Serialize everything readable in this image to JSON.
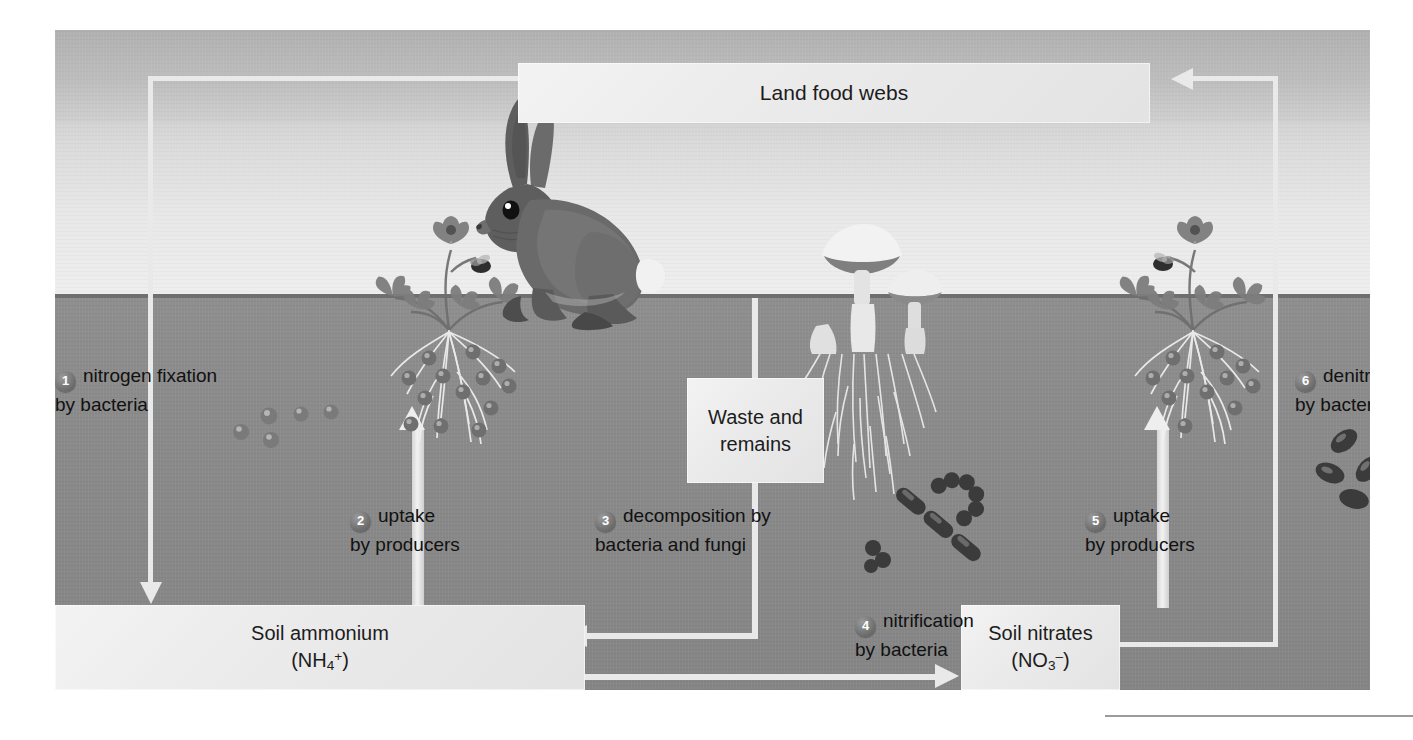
{
  "figure": {
    "title_box": {
      "label": "Land food webs"
    },
    "waste_box": {
      "label_line1": "Waste and",
      "label_line2": "remains"
    },
    "ammonium_box": {
      "name": "Soil ammonium",
      "formula_pre": "(NH",
      "formula_sub": "4",
      "formula_sup": "+",
      "formula_post": ")"
    },
    "nitrates_box": {
      "name": "Soil nitrates",
      "formula_pre": "(NO",
      "formula_sub": "3",
      "formula_sup": "–",
      "formula_post": ")"
    },
    "steps": [
      {
        "number": "1",
        "line1": "nitrogen fixation",
        "line2": "by bacteria"
      },
      {
        "number": "2",
        "line1": "uptake",
        "line2": "by producers"
      },
      {
        "number": "3",
        "line1": "decomposition by",
        "line2": "bacteria and fungi"
      },
      {
        "number": "4",
        "line1": "nitrification",
        "line2": "by bacteria"
      },
      {
        "number": "5",
        "line1": "uptake",
        "line2": "by producers"
      },
      {
        "number": "6",
        "line1": "denitrification",
        "line2": "by bacteria"
      }
    ],
    "colors": {
      "sky": "#dcdcdc",
      "soil": "#8a8a8a",
      "soil_edge": "#6f6f6f",
      "box_fill": "#ececec",
      "arrow": "#e9e9e9",
      "text": "#1c1c1c",
      "badge": "#6a6a6a"
    }
  }
}
